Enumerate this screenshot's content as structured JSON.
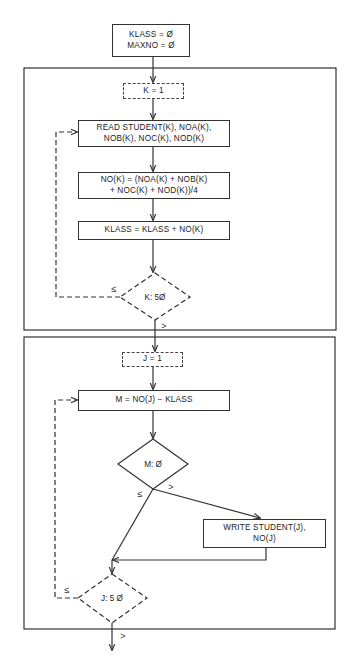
{
  "diagram": {
    "type": "flowchart",
    "colors": {
      "line": "#333333",
      "background": "#ffffff"
    },
    "init_box": {
      "lines": "KLASS = Ø\nMAXNO = Ø"
    },
    "section1": {
      "init_loop": "K = 1",
      "read_box": "READ STUDENT(K), NOA(K),\nNOB(K), NOC(K), NOD(K)",
      "compute_box": "NO(K) = (NOA(K) + NOB(K)\n+ NOC(K) + NOD(K))/4",
      "accumulate_box": "KLASS = KLASS + NO(K)",
      "decision": "K: 5Ø",
      "loop_label": "≤",
      "exit_label": ">"
    },
    "section2": {
      "init_loop": "J = 1",
      "diff_box": "M = NO(J) − KLASS",
      "decision_m": "M: Ø",
      "branch_le": "≤",
      "branch_gt": ">",
      "write_box": "WRITE STUDENT(J),\nNO(J)",
      "decision_j": "J: 5 Ø",
      "loop_label": "≤",
      "exit_label": ">"
    }
  }
}
